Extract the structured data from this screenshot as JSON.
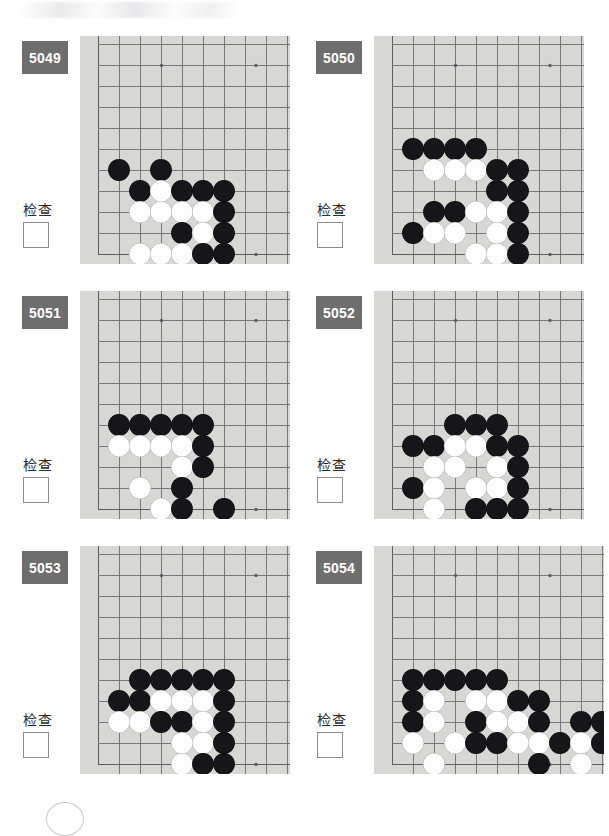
{
  "page": {
    "check_label": "检查",
    "badge_color": "#6e6e6e",
    "board_color": "#d7d7d3",
    "grid_line_color": "#77787c",
    "black_stone_color": "#16161a",
    "white_stone_color": "#fdfdfd"
  },
  "board_geometry": {
    "cell": 21,
    "cols": 10,
    "rows": 11,
    "origin_x": 18,
    "origin_y": 8,
    "star_points": [
      [
        6,
        1
      ],
      [
        15,
        1
      ],
      [
        15,
        10
      ]
    ],
    "note": "coordinates below are grid indices: col from left edge line, row from top"
  },
  "problems": [
    {
      "id": "5049",
      "check_label": "检查",
      "checked": false,
      "wide": false,
      "board": {
        "left_edge_col": 0,
        "bottom_edge_row": 10,
        "stones": [
          {
            "c": 1,
            "r": 6,
            "color": "b"
          },
          {
            "c": 3,
            "r": 6,
            "color": "b"
          },
          {
            "c": 2,
            "r": 7,
            "color": "b"
          },
          {
            "c": 3,
            "r": 7,
            "color": "w"
          },
          {
            "c": 4,
            "r": 7,
            "color": "b"
          },
          {
            "c": 5,
            "r": 7,
            "color": "b"
          },
          {
            "c": 6,
            "r": 7,
            "color": "b"
          },
          {
            "c": 2,
            "r": 8,
            "color": "w"
          },
          {
            "c": 3,
            "r": 8,
            "color": "w"
          },
          {
            "c": 4,
            "r": 8,
            "color": "w"
          },
          {
            "c": 5,
            "r": 8,
            "color": "w"
          },
          {
            "c": 6,
            "r": 8,
            "color": "b"
          },
          {
            "c": 4,
            "r": 9,
            "color": "b"
          },
          {
            "c": 5,
            "r": 9,
            "color": "w"
          },
          {
            "c": 6,
            "r": 9,
            "color": "b"
          },
          {
            "c": 2,
            "r": 10,
            "color": "w"
          },
          {
            "c": 3,
            "r": 10,
            "color": "w"
          },
          {
            "c": 4,
            "r": 10,
            "color": "w"
          },
          {
            "c": 5,
            "r": 10,
            "color": "b"
          },
          {
            "c": 6,
            "r": 10,
            "color": "b"
          }
        ]
      }
    },
    {
      "id": "5050",
      "check_label": "检查",
      "checked": false,
      "wide": false,
      "board": {
        "left_edge_col": 0,
        "bottom_edge_row": 10,
        "stones": [
          {
            "c": 1,
            "r": 5,
            "color": "b"
          },
          {
            "c": 2,
            "r": 5,
            "color": "b"
          },
          {
            "c": 3,
            "r": 5,
            "color": "b"
          },
          {
            "c": 4,
            "r": 5,
            "color": "b"
          },
          {
            "c": 2,
            "r": 6,
            "color": "w"
          },
          {
            "c": 3,
            "r": 6,
            "color": "w"
          },
          {
            "c": 4,
            "r": 6,
            "color": "w"
          },
          {
            "c": 5,
            "r": 6,
            "color": "b"
          },
          {
            "c": 6,
            "r": 6,
            "color": "b"
          },
          {
            "c": 5,
            "r": 7,
            "color": "b"
          },
          {
            "c": 6,
            "r": 7,
            "color": "b"
          },
          {
            "c": 2,
            "r": 8,
            "color": "b"
          },
          {
            "c": 3,
            "r": 8,
            "color": "b"
          },
          {
            "c": 4,
            "r": 8,
            "color": "w"
          },
          {
            "c": 5,
            "r": 8,
            "color": "w"
          },
          {
            "c": 6,
            "r": 8,
            "color": "b"
          },
          {
            "c": 1,
            "r": 9,
            "color": "b"
          },
          {
            "c": 2,
            "r": 9,
            "color": "w"
          },
          {
            "c": 3,
            "r": 9,
            "color": "w"
          },
          {
            "c": 5,
            "r": 9,
            "color": "w"
          },
          {
            "c": 6,
            "r": 9,
            "color": "b"
          },
          {
            "c": 4,
            "r": 10,
            "color": "w"
          },
          {
            "c": 5,
            "r": 10,
            "color": "w"
          },
          {
            "c": 6,
            "r": 10,
            "color": "b"
          }
        ]
      }
    },
    {
      "id": "5051",
      "check_label": "检查",
      "checked": false,
      "wide": false,
      "board": {
        "left_edge_col": 0,
        "bottom_edge_row": 10,
        "stones": [
          {
            "c": 1,
            "r": 6,
            "color": "b"
          },
          {
            "c": 2,
            "r": 6,
            "color": "b"
          },
          {
            "c": 3,
            "r": 6,
            "color": "b"
          },
          {
            "c": 4,
            "r": 6,
            "color": "b"
          },
          {
            "c": 5,
            "r": 6,
            "color": "b"
          },
          {
            "c": 1,
            "r": 7,
            "color": "w"
          },
          {
            "c": 2,
            "r": 7,
            "color": "w"
          },
          {
            "c": 3,
            "r": 7,
            "color": "w"
          },
          {
            "c": 4,
            "r": 7,
            "color": "w"
          },
          {
            "c": 5,
            "r": 7,
            "color": "b"
          },
          {
            "c": 4,
            "r": 8,
            "color": "w"
          },
          {
            "c": 5,
            "r": 8,
            "color": "b"
          },
          {
            "c": 2,
            "r": 9,
            "color": "w"
          },
          {
            "c": 4,
            "r": 9,
            "color": "b"
          },
          {
            "c": 3,
            "r": 10,
            "color": "w"
          },
          {
            "c": 4,
            "r": 10,
            "color": "b"
          },
          {
            "c": 6,
            "r": 10,
            "color": "b"
          },
          {
            "c": 4,
            "r": 11,
            "color": "w"
          }
        ]
      }
    },
    {
      "id": "5052",
      "check_label": "检查",
      "checked": false,
      "wide": false,
      "board": {
        "left_edge_col": 0,
        "bottom_edge_row": 10,
        "stones": [
          {
            "c": 3,
            "r": 6,
            "color": "b"
          },
          {
            "c": 4,
            "r": 6,
            "color": "b"
          },
          {
            "c": 5,
            "r": 6,
            "color": "b"
          },
          {
            "c": 1,
            "r": 7,
            "color": "b"
          },
          {
            "c": 2,
            "r": 7,
            "color": "b"
          },
          {
            "c": 3,
            "r": 7,
            "color": "w"
          },
          {
            "c": 4,
            "r": 7,
            "color": "w"
          },
          {
            "c": 5,
            "r": 7,
            "color": "b"
          },
          {
            "c": 6,
            "r": 7,
            "color": "b"
          },
          {
            "c": 2,
            "r": 8,
            "color": "w"
          },
          {
            "c": 3,
            "r": 8,
            "color": "w"
          },
          {
            "c": 5,
            "r": 8,
            "color": "w"
          },
          {
            "c": 6,
            "r": 8,
            "color": "b"
          },
          {
            "c": 1,
            "r": 9,
            "color": "b"
          },
          {
            "c": 2,
            "r": 9,
            "color": "w"
          },
          {
            "c": 4,
            "r": 9,
            "color": "w"
          },
          {
            "c": 5,
            "r": 9,
            "color": "w"
          },
          {
            "c": 6,
            "r": 9,
            "color": "b"
          },
          {
            "c": 2,
            "r": 10,
            "color": "w"
          },
          {
            "c": 4,
            "r": 10,
            "color": "b"
          },
          {
            "c": 5,
            "r": 10,
            "color": "b"
          },
          {
            "c": 6,
            "r": 10,
            "color": "b"
          },
          {
            "c": 1,
            "r": 11,
            "color": "w"
          },
          {
            "c": 2,
            "r": 11,
            "color": "b"
          },
          {
            "c": 3,
            "r": 11,
            "color": "b"
          }
        ]
      }
    },
    {
      "id": "5053",
      "check_label": "检查",
      "checked": false,
      "wide": false,
      "board": {
        "left_edge_col": 0,
        "bottom_edge_row": 10,
        "stones": [
          {
            "c": 2,
            "r": 6,
            "color": "b"
          },
          {
            "c": 3,
            "r": 6,
            "color": "b"
          },
          {
            "c": 4,
            "r": 6,
            "color": "b"
          },
          {
            "c": 5,
            "r": 6,
            "color": "b"
          },
          {
            "c": 6,
            "r": 6,
            "color": "b"
          },
          {
            "c": 1,
            "r": 7,
            "color": "b"
          },
          {
            "c": 2,
            "r": 7,
            "color": "b"
          },
          {
            "c": 3,
            "r": 7,
            "color": "w"
          },
          {
            "c": 4,
            "r": 7,
            "color": "w"
          },
          {
            "c": 5,
            "r": 7,
            "color": "w"
          },
          {
            "c": 6,
            "r": 7,
            "color": "b"
          },
          {
            "c": 1,
            "r": 8,
            "color": "w"
          },
          {
            "c": 2,
            "r": 8,
            "color": "w"
          },
          {
            "c": 3,
            "r": 8,
            "color": "b"
          },
          {
            "c": 4,
            "r": 8,
            "color": "b"
          },
          {
            "c": 5,
            "r": 8,
            "color": "w"
          },
          {
            "c": 6,
            "r": 8,
            "color": "b"
          },
          {
            "c": 4,
            "r": 9,
            "color": "w"
          },
          {
            "c": 5,
            "r": 9,
            "color": "w"
          },
          {
            "c": 6,
            "r": 9,
            "color": "b"
          },
          {
            "c": 4,
            "r": 10,
            "color": "w"
          },
          {
            "c": 5,
            "r": 10,
            "color": "b"
          },
          {
            "c": 6,
            "r": 10,
            "color": "b"
          },
          {
            "c": 4,
            "r": 11,
            "color": "w"
          },
          {
            "c": 5,
            "r": 11,
            "color": "b"
          }
        ]
      }
    },
    {
      "id": "5054",
      "check_label": "检查",
      "checked": false,
      "wide": true,
      "board": {
        "left_edge_col": 0,
        "bottom_edge_row": 10,
        "stones": [
          {
            "c": 1,
            "r": 6,
            "color": "b"
          },
          {
            "c": 2,
            "r": 6,
            "color": "b"
          },
          {
            "c": 3,
            "r": 6,
            "color": "b"
          },
          {
            "c": 4,
            "r": 6,
            "color": "b"
          },
          {
            "c": 5,
            "r": 6,
            "color": "b"
          },
          {
            "c": 1,
            "r": 7,
            "color": "b"
          },
          {
            "c": 2,
            "r": 7,
            "color": "w"
          },
          {
            "c": 4,
            "r": 7,
            "color": "w"
          },
          {
            "c": 5,
            "r": 7,
            "color": "w"
          },
          {
            "c": 6,
            "r": 7,
            "color": "b"
          },
          {
            "c": 7,
            "r": 7,
            "color": "b"
          },
          {
            "c": 1,
            "r": 8,
            "color": "b"
          },
          {
            "c": 2,
            "r": 8,
            "color": "w"
          },
          {
            "c": 4,
            "r": 8,
            "color": "b"
          },
          {
            "c": 5,
            "r": 8,
            "color": "w"
          },
          {
            "c": 6,
            "r": 8,
            "color": "w"
          },
          {
            "c": 7,
            "r": 8,
            "color": "b"
          },
          {
            "c": 9,
            "r": 8,
            "color": "b"
          },
          {
            "c": 10,
            "r": 8,
            "color": "b"
          },
          {
            "c": 1,
            "r": 9,
            "color": "w"
          },
          {
            "c": 3,
            "r": 9,
            "color": "w"
          },
          {
            "c": 4,
            "r": 9,
            "color": "b"
          },
          {
            "c": 5,
            "r": 9,
            "color": "b"
          },
          {
            "c": 6,
            "r": 9,
            "color": "w"
          },
          {
            "c": 7,
            "r": 9,
            "color": "w"
          },
          {
            "c": 8,
            "r": 9,
            "color": "b"
          },
          {
            "c": 9,
            "r": 9,
            "color": "w"
          },
          {
            "c": 10,
            "r": 9,
            "color": "b"
          },
          {
            "c": 2,
            "r": 10,
            "color": "w"
          },
          {
            "c": 7,
            "r": 10,
            "color": "b"
          },
          {
            "c": 9,
            "r": 10,
            "color": "w"
          }
        ]
      }
    }
  ]
}
